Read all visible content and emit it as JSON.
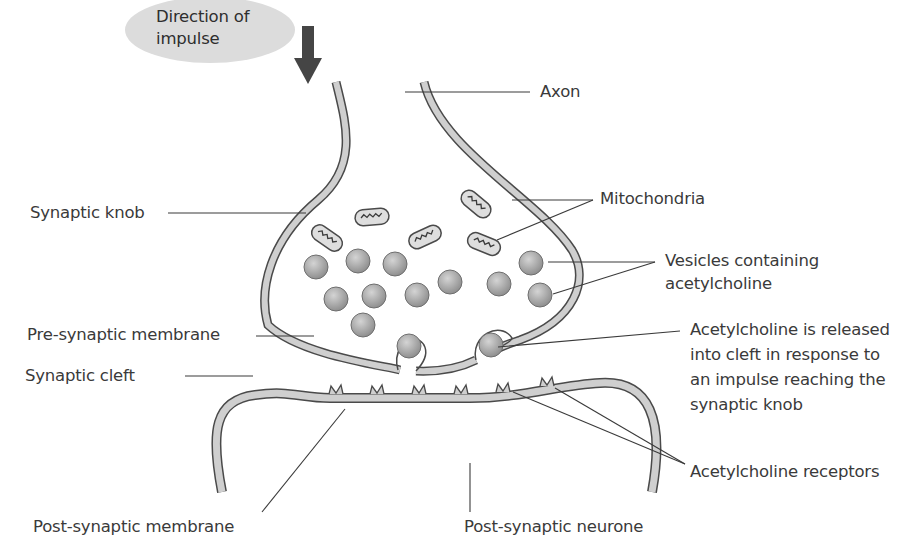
{
  "diagram": {
    "colors": {
      "membrane_fill": "#cfcfcf",
      "membrane_stroke": "#4a4a4a",
      "vesicle_fill": "#a9a9a9",
      "impulse_oval": "#dedede",
      "arrow": "#4a4a4a",
      "text": "#3a3a3a"
    },
    "impulse": {
      "line1": "Direction of",
      "line2": "impulse",
      "arrow_icon": "arrow-down"
    },
    "labels": {
      "axon": "Axon",
      "synaptic_knob": "Synaptic knob",
      "mitochondria": "Mitochondria",
      "vesicles_line1": "Vesicles containing",
      "vesicles_line2": "acetylcholine",
      "pre_synaptic_membrane": "Pre-synaptic membrane",
      "synaptic_cleft": "Synaptic cleft",
      "ach_released_line1": "Acetylcholine is released",
      "ach_released_line2": "into cleft in response to",
      "ach_released_line3": "an impulse reaching the",
      "ach_released_line4": "synaptic knob",
      "ach_receptors": "Acetylcholine receptors",
      "post_synaptic_membrane": "Post-synaptic membrane",
      "post_synaptic_neurone": "Post-synaptic neurone"
    }
  }
}
